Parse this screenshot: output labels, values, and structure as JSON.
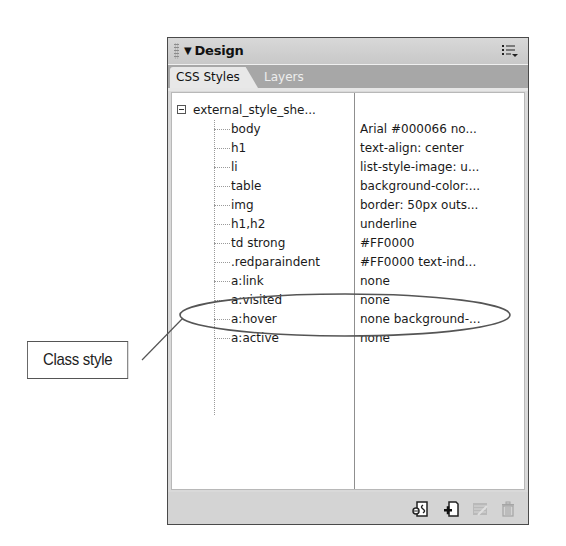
{
  "panel": {
    "title": "Design",
    "title_arrow": "▼",
    "options_icon": "panel-options-icon",
    "tabs": [
      {
        "label": "CSS Styles",
        "active": true
      },
      {
        "label": "Layers",
        "active": false
      }
    ]
  },
  "tree": {
    "root": {
      "label": "external_style_she...",
      "expanded": true
    },
    "rules": [
      {
        "selector": "body",
        "properties": "Arial #000066 no..."
      },
      {
        "selector": "h1",
        "properties": "text-align: center"
      },
      {
        "selector": "li",
        "properties": "list-style-image: u..."
      },
      {
        "selector": "table",
        "properties": "background-color:..."
      },
      {
        "selector": "img",
        "properties": "border: 50px outs..."
      },
      {
        "selector": "h1,h2",
        "properties": "underline"
      },
      {
        "selector": "td strong",
        "properties": "#FF0000"
      },
      {
        "selector": ".redparaindent",
        "properties": "#FF0000 text-ind..."
      },
      {
        "selector": "a:link",
        "properties": "none"
      },
      {
        "selector": "a:visited",
        "properties": "none"
      },
      {
        "selector": "a:hover",
        "properties": "none background-..."
      },
      {
        "selector": "a:active",
        "properties": "none"
      }
    ]
  },
  "footer": {
    "buttons": [
      {
        "name": "attach-style-sheet",
        "icon": "attach-style-sheet-icon",
        "enabled": true
      },
      {
        "name": "new-css-rule",
        "icon": "new-css-rule-icon",
        "enabled": true
      },
      {
        "name": "edit-style",
        "icon": "edit-style-icon",
        "enabled": false
      },
      {
        "name": "delete-css-rule",
        "icon": "trash-icon",
        "enabled": false
      }
    ]
  },
  "annotation": {
    "label": "Class style",
    "highlighted_rule": ".redparaindent"
  }
}
